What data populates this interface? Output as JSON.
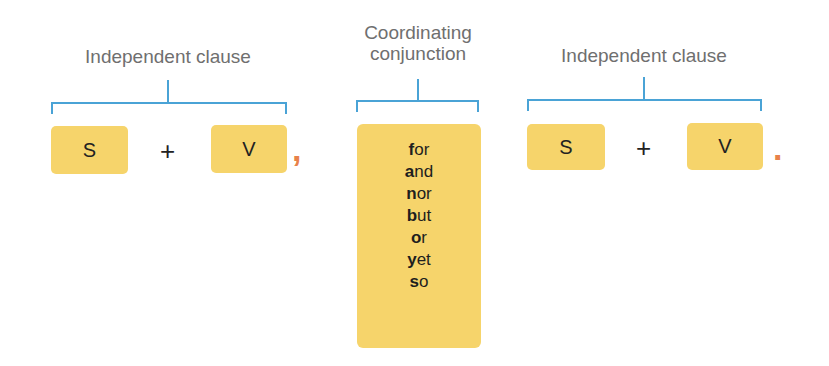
{
  "left_clause": {
    "label": "Independent clause",
    "subject": "S",
    "plus": "+",
    "verb": "V",
    "punctuation": ","
  },
  "conjunction": {
    "label_line1": "Coordinating",
    "label_line2": "conjunction",
    "items": [
      {
        "initial": "f",
        "rest": "or"
      },
      {
        "initial": "a",
        "rest": "nd"
      },
      {
        "initial": "n",
        "rest": "or"
      },
      {
        "initial": "b",
        "rest": "ut"
      },
      {
        "initial": "o",
        "rest": "r"
      },
      {
        "initial": "y",
        "rest": "et"
      },
      {
        "initial": "s",
        "rest": "o"
      }
    ]
  },
  "right_clause": {
    "label": "Independent clause",
    "subject": "S",
    "plus": "+",
    "verb": "V",
    "punctuation": "."
  },
  "colors": {
    "box": "#f6d46b",
    "bracket": "#4aa3d6",
    "label": "#6f6f6f",
    "punctuation": "#e8824a"
  }
}
